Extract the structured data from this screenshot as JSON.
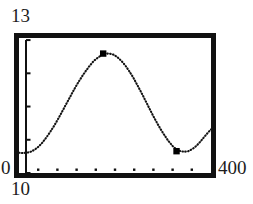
{
  "figure": {
    "frame_color": "#111111",
    "curve_color": "#141414",
    "marker_color": "#000000",
    "background": "#ffffff"
  },
  "labels": {
    "y_max": "13",
    "y_min": "0",
    "x_min": "10",
    "x_max": "400"
  },
  "chart_data": {
    "type": "line",
    "title": "",
    "subtitle": "",
    "xlabel": "",
    "ylabel": "",
    "xlim": [
      10,
      400
    ],
    "ylim": [
      0,
      13
    ],
    "grid": false,
    "legend": false,
    "legend_position": "none",
    "line_style": "dotted",
    "xticks": [
      49,
      88,
      127,
      166,
      205,
      244,
      283,
      322,
      361
    ],
    "xticklabels": [
      "",
      "",
      "",
      "",
      "",
      "",
      "",
      "",
      ""
    ],
    "yticks": [
      0,
      3.2,
      6.4,
      9.6,
      12.8
    ],
    "yticklabels": [
      "",
      "",
      "",
      "",
      ""
    ],
    "annotations": [
      {
        "name": "peak-marker",
        "x": 181,
        "y": 11.5,
        "marker": "square"
      },
      {
        "name": "trough-marker",
        "x": 330,
        "y": 2.1,
        "marker": "square"
      }
    ],
    "series": [
      {
        "name": "curve",
        "x": [
          10,
          18,
          26,
          34,
          42,
          50,
          58,
          66,
          74,
          82,
          90,
          98,
          106,
          114,
          122,
          130,
          138,
          146,
          154,
          162,
          170,
          178,
          186,
          194,
          202,
          210,
          218,
          226,
          234,
          242,
          250,
          258,
          266,
          274,
          282,
          290,
          298,
          306,
          314,
          322,
          330,
          338,
          346,
          354,
          362,
          370,
          378,
          386,
          394,
          400
        ],
        "y": [
          1.95,
          1.92,
          1.95,
          2.05,
          2.25,
          2.55,
          2.95,
          3.45,
          4.0,
          4.6,
          5.25,
          5.95,
          6.65,
          7.35,
          8.05,
          8.7,
          9.3,
          9.85,
          10.35,
          10.8,
          11.1,
          11.35,
          11.5,
          11.5,
          11.4,
          11.15,
          10.8,
          10.35,
          9.8,
          9.2,
          8.5,
          7.8,
          7.05,
          6.3,
          5.55,
          4.85,
          4.2,
          3.6,
          3.05,
          2.6,
          2.25,
          2.1,
          2.05,
          2.1,
          2.3,
          2.6,
          3.0,
          3.45,
          3.9,
          4.2
        ]
      }
    ]
  }
}
